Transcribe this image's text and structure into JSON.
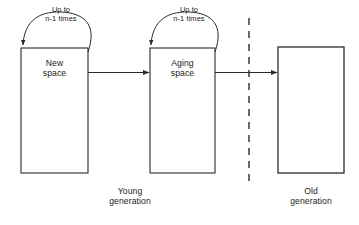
{
  "diagram": {
    "stroke_color": "#2b2b2b",
    "text_color": "#1a1a1a",
    "background_color": "#ffffff",
    "boxes": [
      {
        "id": "new-space",
        "label": "New\nspace",
        "x": 21,
        "y": 48,
        "width": 67,
        "height": 125
      },
      {
        "id": "aging-space",
        "label": "Aging\nspace",
        "x": 150,
        "y": 48,
        "width": 65,
        "height": 125
      },
      {
        "id": "old-space",
        "label": "",
        "x": 278,
        "y": 47,
        "width": 66,
        "height": 126
      }
    ],
    "loop_arrows": [
      {
        "id": "new-space-loop",
        "label": "Up to\nn-1 times",
        "label_x": 33,
        "label_y": 6,
        "label_width": 56
      },
      {
        "id": "aging-space-loop",
        "label": "Up to\nn-1 times",
        "label_x": 161,
        "label_y": 6,
        "label_width": 56
      }
    ],
    "flow_arrows": [
      {
        "id": "new-to-aging",
        "from": "new-space",
        "to": "aging-space"
      },
      {
        "id": "aging-to-old",
        "from": "aging-space",
        "to": "old-space"
      }
    ],
    "divider": {
      "id": "generation-divider",
      "style": "dashed",
      "x": 249,
      "y1": 18,
      "y2": 185
    },
    "region_labels": [
      {
        "id": "young-generation",
        "label": "Young\ngeneration",
        "x": 95,
        "y": 186,
        "width": 70
      },
      {
        "id": "old-generation",
        "label": "Old\ngeneration",
        "x": 276,
        "y": 186,
        "width": 70
      }
    ]
  }
}
